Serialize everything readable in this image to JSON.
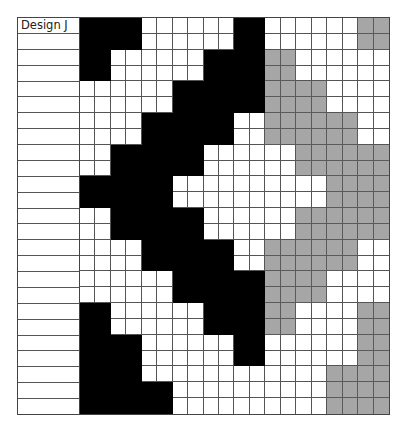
{
  "title": "Design J",
  "colors": {
    "B": "#000000",
    "G": "#a6a6a6",
    "W": "#ffffff",
    "grid_line": "#555555"
  },
  "grid": {
    "columns": 20,
    "rows": 25,
    "legend": {
      "B": "black",
      "G": "gray",
      "W": "white"
    },
    "pattern": [
      "BBBBWWWWWWBBWWWWWWGG",
      "BBBBWWWWWWBBWWWWWWGG",
      "BBWWWWWWBBBBGGWWWWWW",
      "BBWWWWWWBBBBGGWWWWWW",
      "WWWWWWBBBBBBGGGGWWWW",
      "WWWWWWBBBBBBGGGGWWWW",
      "WWWWBBBBBBWWGGGGGGWW",
      "WWWWBBBBBBWWGGGGGGWW",
      "WWBBBBBBWWWWWWGGGGGG",
      "WWBBBBBBWWWWWWGGGGGG",
      "BBBBBBWWWWWWWWWWGGGG",
      "BBBBBBWWWWWWWWWWGGGG",
      "WWBBBBBBWWWWWWGGGGGG",
      "WWBBBBBBWWWWWWGGGGGG",
      "WWWWBBBBBBWWGGGGGGWW",
      "WWWWBBBBBBWWGGGGGGWW",
      "WWWWWWBBBBBBGGGGWWWW",
      "WWWWWWBBBBBBGGGGWWWW",
      "BBWWWWWWBBBBGGWWWWGG",
      "BBWWWWWWBBBBGGWWWWGG",
      "BBBBWWWWWWBBWWWWWWGG",
      "BBBBWWWWWWBBWWWWWWGG",
      "BBBBWWWWWWWWWWWWGGGG",
      "BBBBBBWWWWWWWWWWGGGG",
      "BBBBBBWWWWWWWWWWGGGG"
    ]
  },
  "row_labels": [
    "Design J",
    "",
    "",
    "",
    "",
    "",
    "",
    "",
    "",
    "",
    "",
    "",
    "",
    "",
    "",
    "",
    "",
    "",
    "",
    "",
    "",
    "",
    "",
    "",
    ""
  ]
}
